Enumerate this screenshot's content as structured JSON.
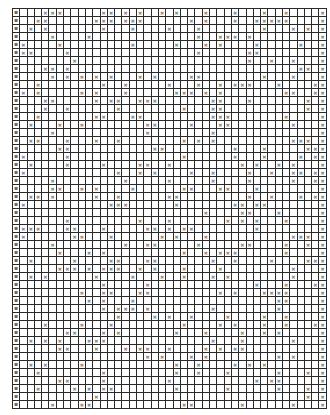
{
  "document": {
    "type": "cross-mark grid worksheet",
    "cell_contents_legible": false,
    "note": "Individual cell marks and row labels are not legible at this resolution. The mark pattern below is generated to approximate the observed density and layout; it is not a transcription of the actual cells."
  },
  "grid": {
    "columns": 43,
    "rows": 50,
    "label_column": "left",
    "right_column_filled": true,
    "approx_mark_density": 0.2,
    "pattern_seed": 20240517,
    "colors": {
      "grid_line": "#2a2a2a",
      "mark": "#8a8a8a",
      "label": "#6a6a6a",
      "background": "#ffffff"
    }
  }
}
